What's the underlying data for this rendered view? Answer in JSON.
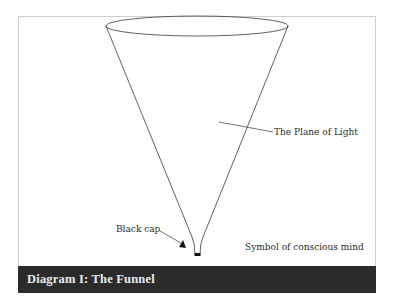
{
  "diagram": {
    "caption": "Diagram I: The Funnel",
    "labels": {
      "plane_of_light": "The Plane of Light",
      "black_cap": "Black cap",
      "symbol": "Symbol of conscious mind"
    },
    "colors": {
      "line": "#3a3a3a",
      "caption_bg": "#2b2b2b",
      "caption_text": "#ececec",
      "frame_border": "#cfcfcf"
    }
  }
}
